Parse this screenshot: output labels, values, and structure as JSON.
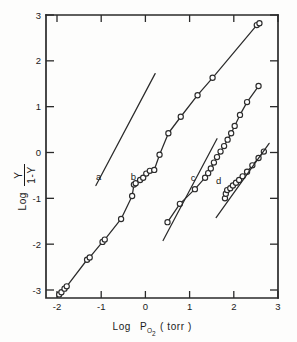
{
  "figure": {
    "background_color": "#fdfdfc",
    "ink_color": "#2b2b2b"
  },
  "axes": {
    "x": {
      "title_main": "Log",
      "title_symbol": "P",
      "title_subscript": "O",
      "title_subscript2": "2",
      "title_units": "( torr )",
      "full_label": "Log P O2 ( torr )",
      "ticks": [
        "-2",
        "-1",
        "0",
        "1",
        "2",
        "3"
      ],
      "tick_values": [
        -2,
        -1,
        0,
        1,
        2,
        3
      ],
      "range": [
        -2.2,
        3.0
      ]
    },
    "y": {
      "title_main": "Log",
      "frac_numerator": "Y",
      "frac_denominator": "1-Y",
      "full_label": "Log Y / 1-Y",
      "ticks": [
        "3",
        "2",
        "1",
        "0",
        "-1",
        "-2",
        "-3"
      ],
      "tick_values": [
        3,
        2,
        1,
        0,
        -1,
        -2,
        -3
      ],
      "range": [
        -3.35,
        3.0
      ]
    }
  },
  "chart_data": {
    "type": "scatter",
    "title": "",
    "xlabel": "Log P_O2 (torr)",
    "ylabel": "Log Y/(1-Y)",
    "xlim": [
      -2.2,
      3.0
    ],
    "ylim": [
      -3.35,
      3.0
    ],
    "grid": false,
    "legend": "inline curve labels a, b, c, d",
    "series": [
      {
        "name": "a",
        "label": "a",
        "label_x": -1.06,
        "label_y": -0.6,
        "kind": "reference-line",
        "markers": false,
        "line_endpoints": [
          [
            -1.12,
            -0.72
          ],
          [
            0.22,
            1.72
          ]
        ],
        "slope": 1.82
      },
      {
        "name": "b",
        "label": "b",
        "label_x": -0.27,
        "label_y": -0.6,
        "kind": "data-with-curve",
        "markers": true,
        "x": [
          -1.95,
          -1.9,
          -1.83,
          -1.78,
          -1.32,
          -1.26,
          -0.97,
          -0.92,
          -0.55,
          -0.3,
          -0.26,
          -0.22,
          -0.12,
          -0.05,
          0.02,
          0.1,
          0.2,
          0.32,
          0.52,
          0.8,
          1.18,
          1.52,
          2.52,
          2.58
        ],
        "y": [
          -3.1,
          -3.05,
          -2.97,
          -2.92,
          -2.34,
          -2.29,
          -1.95,
          -1.9,
          -1.45,
          -0.95,
          -0.7,
          -0.67,
          -0.6,
          -0.55,
          -0.46,
          -0.4,
          -0.38,
          -0.05,
          0.42,
          0.78,
          1.25,
          1.63,
          2.78,
          2.82
        ]
      },
      {
        "name": "c",
        "label": "c",
        "label_x": 1.08,
        "label_y": -0.62,
        "kind": "data-with-curve",
        "markers": true,
        "x": [
          0.5,
          0.78,
          1.12,
          1.35,
          1.42,
          1.48,
          1.55,
          1.62,
          1.7,
          1.78,
          1.86,
          1.94,
          2.02,
          2.14,
          2.3,
          2.56
        ],
        "y": [
          -1.52,
          -1.12,
          -0.8,
          -0.55,
          -0.45,
          -0.35,
          -0.22,
          -0.1,
          0.02,
          0.14,
          0.28,
          0.42,
          0.58,
          0.82,
          1.1,
          1.45
        ]
      },
      {
        "name": "d",
        "label": "d",
        "label_x": 1.66,
        "label_y": -0.68,
        "kind": "data-with-curve",
        "markers": true,
        "x": [
          1.8,
          1.82,
          1.85,
          1.92,
          1.98,
          2.05,
          2.12,
          2.2,
          2.3,
          2.42,
          2.56,
          2.68
        ],
        "y": [
          -1.0,
          -0.9,
          -0.82,
          -0.78,
          -0.72,
          -0.66,
          -0.6,
          -0.52,
          -0.42,
          -0.28,
          -0.12,
          0.02
        ]
      },
      {
        "name": "c-reference-line",
        "label": "",
        "kind": "reference-line",
        "markers": false,
        "line_endpoints": [
          [
            0.4,
            -1.92
          ],
          [
            1.62,
            0.3
          ]
        ],
        "slope": 1.82
      },
      {
        "name": "d-reference-line",
        "label": "",
        "kind": "reference-line",
        "markers": false,
        "line_endpoints": [
          [
            1.6,
            -1.42
          ],
          [
            2.8,
            0.2
          ]
        ],
        "slope": 1.35
      }
    ]
  }
}
